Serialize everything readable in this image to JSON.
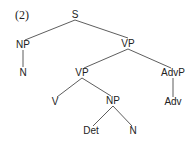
{
  "example_number": "(2)",
  "tree": {
    "S": "S",
    "NP1": "NP",
    "N1": "N",
    "VP1": "VP",
    "VP2": "VP",
    "AdvP": "AdvP",
    "V": "V",
    "NP2": "NP",
    "Adv": "Adv",
    "Det": "Det",
    "N2": "N"
  },
  "line_color": "#333333"
}
